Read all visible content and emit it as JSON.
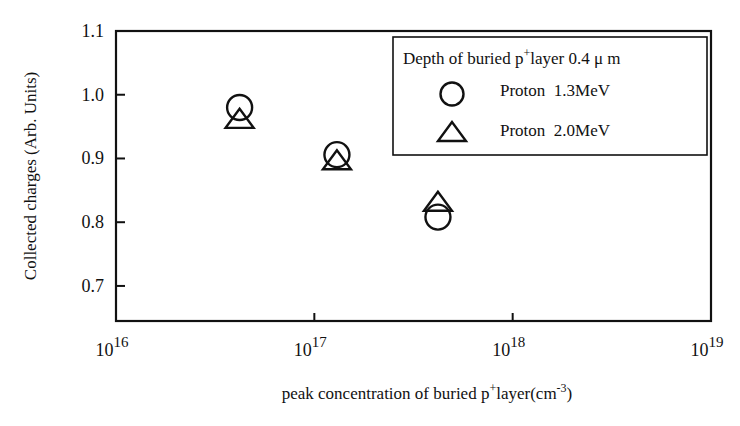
{
  "chart_data": {
    "type": "scatter",
    "title": "",
    "xlabel": "peak concentration of buried p+layer(cm-3)",
    "xlabel_parts": {
      "pre": "peak concentration of buried p",
      "sup1": "+",
      "mid": "layer(cm",
      "sup2": "-3",
      "post": ")"
    },
    "ylabel": "Collected charges  (Arb. Units)",
    "x_scale": "log",
    "xlim": [
      1e+16,
      1e+19
    ],
    "ylim": [
      0.645,
      1.1
    ],
    "x_ticks": [
      {
        "base": "10",
        "exp": "16",
        "value": 1e+16
      },
      {
        "base": "10",
        "exp": "17",
        "value": 1e+17
      },
      {
        "base": "10",
        "exp": "18",
        "value": 1e+18
      },
      {
        "base": "10",
        "exp": "19",
        "value": 1e+19
      }
    ],
    "y_ticks": [
      "0.7",
      "0.8",
      "0.9",
      "1.0",
      "1.1"
    ],
    "grid": false,
    "legend": {
      "position": "upper right",
      "title_parts": {
        "pre": "Depth of  buried p",
        "sup": "+",
        "post": "layer  0.4 μ m"
      },
      "title": "Depth of buried p+layer 0.4 μm"
    },
    "series": [
      {
        "name": "Proton  1.3MeV",
        "marker": "circle",
        "x": [
          4.2e+16,
          1.3e+17,
          4.2e+17
        ],
        "y": [
          0.98,
          0.906,
          0.808
        ]
      },
      {
        "name": "Proton  2.0MeV",
        "marker": "triangle",
        "x": [
          4.2e+16,
          1.3e+17,
          4.2e+17
        ],
        "y": [
          0.96,
          0.895,
          0.83
        ]
      }
    ]
  },
  "style": {
    "ink": "#111111",
    "background": "#ffffff"
  }
}
